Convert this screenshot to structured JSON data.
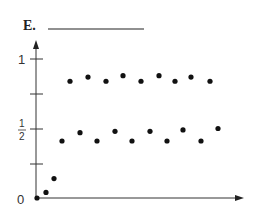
{
  "chart_data": {
    "type": "scatter",
    "title": "E.",
    "xlabel": "",
    "ylabel": "",
    "ylim": [
      0,
      1.1
    ],
    "y_ticks": [
      0,
      0.25,
      0.5,
      0.75,
      1
    ],
    "y_tick_labels": [
      "0",
      "",
      "1/2",
      "",
      "1"
    ],
    "grid": false,
    "x": [
      0,
      1,
      2,
      3,
      4,
      5,
      6,
      7,
      8,
      9,
      10,
      11,
      12,
      13,
      14,
      15,
      16,
      17,
      18,
      19,
      20,
      21
    ],
    "values": [
      0,
      0.04,
      0.14,
      0.41,
      0.84,
      0.47,
      0.87,
      0.41,
      0.84,
      0.48,
      0.88,
      0.41,
      0.84,
      0.48,
      0.88,
      0.41,
      0.84,
      0.49,
      0.87,
      0.41,
      0.84,
      0.5
    ],
    "point_px_x": [
      37,
      46,
      54,
      62,
      70,
      80,
      88,
      97,
      106,
      115,
      123,
      132,
      141,
      150,
      159,
      167,
      175,
      183,
      191,
      201,
      210,
      218
    ]
  },
  "labels": {
    "title": "E.",
    "y0": "0",
    "yhalf_num": "1",
    "yhalf_den": "2",
    "y1": "1"
  }
}
